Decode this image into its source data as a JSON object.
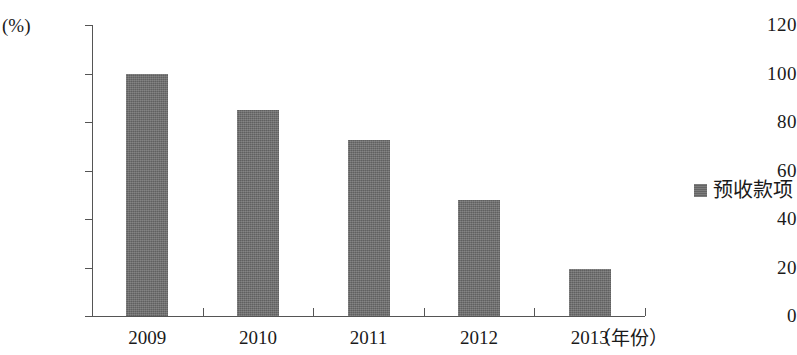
{
  "chart_data": {
    "type": "bar",
    "title": "",
    "subtitle": "",
    "categories": [
      "2009",
      "2010",
      "2011",
      "2012",
      "2013"
    ],
    "series": [
      {
        "name": "预收款项",
        "values": [
          100,
          85,
          72.5,
          48,
          19.5
        ],
        "color": "#6b6b6b"
      }
    ],
    "xlabel": "（年份）",
    "ylabel": "(%)",
    "ylim": [
      0,
      120
    ],
    "yticks": [
      0,
      20,
      40,
      60,
      80,
      100,
      120
    ],
    "ytick_labels": [
      "0",
      "20",
      "40",
      "60",
      "80",
      "100",
      "120"
    ],
    "xtick_labels": [
      "2009",
      "2010",
      "2011",
      "2012",
      "2013"
    ],
    "grid": false,
    "legend_position": "right"
  },
  "axes": {
    "unit_label": "(%)",
    "x_axis_title": "（年份）"
  },
  "legend": {
    "entries": [
      {
        "label": "预收款项",
        "color": "#6b6b6b",
        "marker": "square-swatch"
      }
    ]
  }
}
